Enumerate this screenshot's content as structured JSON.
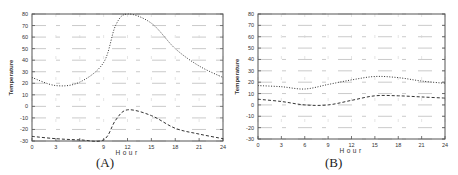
{
  "chart_data": [
    {
      "type": "line",
      "panel_label": "(A)",
      "title": "",
      "xlabel": "Hour",
      "ylabel": "Temperature",
      "xlim": [
        0,
        24
      ],
      "ylim": [
        -30,
        80
      ],
      "x_ticks": [
        0,
        3,
        6,
        9,
        12,
        15,
        18,
        21,
        24
      ],
      "y_ticks": [
        -30,
        -20,
        -10,
        0,
        10,
        20,
        30,
        40,
        50,
        60,
        70,
        80
      ],
      "grid": true,
      "legend": "none",
      "series": [
        {
          "name": "upper (dotted)",
          "style": "dotted",
          "x": [
            0,
            3,
            6,
            9,
            10.5,
            12,
            15,
            18,
            21,
            24
          ],
          "values": [
            25,
            18,
            21,
            38,
            70,
            80,
            72,
            50,
            35,
            25
          ]
        },
        {
          "name": "lower (dashed)",
          "style": "dashed",
          "x": [
            0,
            3,
            6,
            9,
            10.5,
            12,
            15,
            18,
            21,
            24
          ],
          "values": [
            -26,
            -28,
            -29,
            -29,
            -12,
            -3,
            -8,
            -19,
            -24,
            -28
          ]
        }
      ]
    },
    {
      "type": "line",
      "panel_label": "(B)",
      "title": "",
      "xlabel": "Hour",
      "ylabel": "Temperature",
      "xlim": [
        0,
        24
      ],
      "ylim": [
        -30,
        80
      ],
      "x_ticks": [
        0,
        3,
        6,
        9,
        12,
        15,
        18,
        21,
        24
      ],
      "y_ticks": [
        -30,
        -20,
        -10,
        0,
        10,
        20,
        30,
        40,
        50,
        60,
        70,
        80
      ],
      "grid": true,
      "legend": "none",
      "series": [
        {
          "name": "upper (dotted)",
          "style": "dotted",
          "x": [
            0,
            3,
            6,
            9,
            12,
            15,
            18,
            21,
            24
          ],
          "values": [
            17,
            16,
            14,
            18,
            22,
            25,
            24,
            21,
            19
          ]
        },
        {
          "name": "lower (dashed)",
          "style": "dashed",
          "x": [
            0,
            3,
            6,
            9,
            12,
            15,
            18,
            21,
            24
          ],
          "values": [
            5,
            3,
            0,
            0,
            4,
            8,
            8,
            7,
            6
          ]
        }
      ]
    }
  ],
  "captions": {
    "a": "(A)",
    "b": "(B)"
  }
}
